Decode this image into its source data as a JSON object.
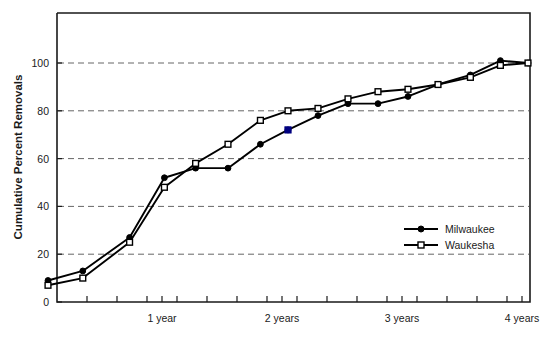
{
  "chart_data": {
    "type": "line",
    "title": "",
    "xlabel": "",
    "ylabel": "Cumulative Percent Removals",
    "ylim": [
      0,
      110
    ],
    "xlim": [
      0,
      4.3
    ],
    "grid": "horizontal-dashed",
    "legend_position": "center-right-inside",
    "y_ticks": [
      0,
      20,
      40,
      60,
      80,
      100
    ],
    "y_tick_labels": [
      "0",
      "20",
      "40",
      "60",
      "80",
      "100"
    ],
    "x_tick_labels": [
      "1 year",
      "2 years",
      "3 years",
      "4 years"
    ],
    "x_tick_values": [
      1,
      2,
      3,
      4
    ],
    "x_minor_ticks": [
      0.125,
      0.375,
      0.625,
      0.875,
      1.125,
      1.375,
      1.625,
      1.875,
      2.125,
      2.375,
      2.625,
      2.875,
      3.125,
      3.375,
      3.625,
      3.875,
      4.125
    ],
    "series": [
      {
        "name": "Milwaukee",
        "marker": "filled-circle",
        "color": "#000000",
        "x": [
          0.05,
          0.34,
          0.73,
          1.02,
          1.28,
          1.55,
          1.82,
          2.05,
          2.3,
          2.55,
          2.8,
          3.05,
          3.3,
          3.57,
          3.82,
          4.05
        ],
        "y": [
          9,
          13,
          27,
          52,
          56,
          56,
          66,
          72,
          78,
          83,
          83,
          86,
          91,
          95,
          101,
          100
        ]
      },
      {
        "name": "Waukesha",
        "marker": "open-square",
        "color": "#000000",
        "x": [
          0.05,
          0.34,
          0.73,
          1.02,
          1.28,
          1.55,
          1.82,
          2.05,
          2.3,
          2.55,
          2.8,
          3.05,
          3.3,
          3.57,
          3.82,
          4.05
        ],
        "y": [
          7,
          10,
          25,
          48,
          58,
          66,
          76,
          80,
          81,
          85,
          88,
          89,
          91,
          94,
          99,
          100
        ]
      }
    ],
    "highlighted_point": {
      "series": "Milwaukee",
      "x": 2.05,
      "y": 72,
      "color": "#000080",
      "marker": "filled-square"
    }
  },
  "legend": {
    "entries": [
      {
        "label": "Milwaukee",
        "marker": "filled-circle"
      },
      {
        "label": "Waukesha",
        "marker": "open-square"
      }
    ]
  }
}
